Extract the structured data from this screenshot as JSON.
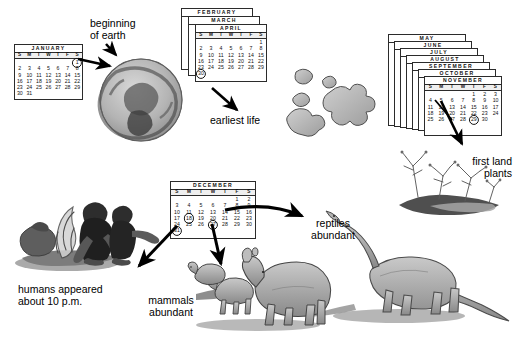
{
  "figure": {
    "type": "cosmic-calendar-diagram"
  },
  "labels": {
    "beginning_of_earth": "beginning\nof earth",
    "earliest_life": "earliest life",
    "first_land_plants": "first land\nplants",
    "reptiles_abundant": "reptiles\nabundant",
    "mammals_abundant": "mammals\nabundant",
    "humans_appeared": "humans appeared\nabout 10 p.m."
  },
  "weekdays": [
    "S",
    "M",
    "T",
    "W",
    "T",
    "F",
    "S"
  ],
  "calendars": {
    "january": {
      "month": "JANUARY",
      "lead_blanks": 6,
      "days": 31,
      "circled": [
        1
      ]
    },
    "spring_stack": {
      "months": [
        "FEBRUARY",
        "MARCH",
        "APRIL"
      ],
      "front_month": "APRIL",
      "lead_blanks": 6,
      "days": 30,
      "circled": [
        30
      ]
    },
    "autumn_stack": {
      "months": [
        "MAY",
        "JUNE",
        "JULY",
        "AUGUST",
        "SEPTEMBER",
        "OCTOBER",
        "NOVEMBER"
      ],
      "front_month": "NOVEMBER",
      "lead_blanks": 4,
      "days": 30,
      "circled": [
        29
      ]
    },
    "december": {
      "month": "DECEMBER",
      "lead_blanks": 5,
      "days": 31,
      "circled": [
        18,
        27,
        31
      ]
    }
  },
  "illustrations": [
    {
      "name": "early-earth-sphere",
      "caption": "beginning of earth"
    },
    {
      "name": "amoeba-blobs",
      "caption": "earliest life"
    },
    {
      "name": "first-land-plants-scene",
      "caption": "first land plants"
    },
    {
      "name": "sauropod-dinosaur",
      "caption": "reptiles abundant"
    },
    {
      "name": "rhino-and-sheep",
      "caption": "mammals abundant"
    },
    {
      "name": "early-humans-at-fire",
      "caption": "humans appeared about 10 p.m."
    }
  ],
  "colors": {
    "ink": "#000000",
    "rule": "#2b2b2b",
    "paper": "#ffffff",
    "shade": "#8a8a8a"
  }
}
